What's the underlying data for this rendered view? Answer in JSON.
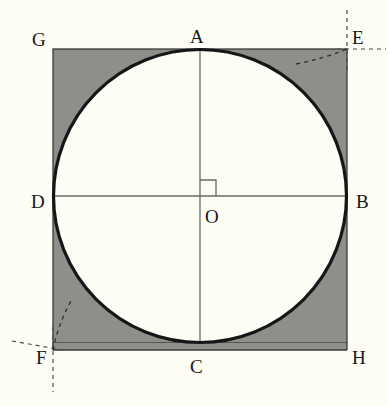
{
  "figure": {
    "background_color": "#fdfdf6",
    "shaded_fill_color": "#8e8e8a",
    "circle_fill_color": "#fdfdf6",
    "outline_color": "#161616",
    "thin_line_color": "#6b6b66",
    "dashed_line_color": "#4a4a46"
  },
  "square": {
    "name": "GEHF",
    "left": 53,
    "top": 49,
    "side": 294,
    "stroke_width": 1.2
  },
  "circle": {
    "center_x": 200,
    "center_y": 196,
    "radius": 147,
    "stroke_width": 3
  },
  "center_point": {
    "label": "O",
    "x": 200,
    "y": 196
  },
  "right_angle_marker": {
    "size": 16,
    "quadrant": "upper-right"
  },
  "diameters": [
    {
      "name": "vertical-diameter",
      "from": "A",
      "to": "C"
    },
    {
      "name": "horizontal-diameter",
      "from": "D",
      "to": "B"
    }
  ],
  "labels": [
    {
      "id": "G",
      "text": "G",
      "x": 32,
      "y": 30,
      "role": "square-corner-top-left"
    },
    {
      "id": "A",
      "text": "A",
      "x": 190,
      "y": 27,
      "role": "circle-tangent-top"
    },
    {
      "id": "E",
      "text": "E",
      "x": 352,
      "y": 28,
      "role": "square-corner-top-right"
    },
    {
      "id": "D",
      "text": "D",
      "x": 31,
      "y": 192,
      "role": "circle-tangent-left"
    },
    {
      "id": "O",
      "text": "O",
      "x": 205,
      "y": 207,
      "role": "circle-center"
    },
    {
      "id": "B",
      "text": "B",
      "x": 356,
      "y": 192,
      "role": "circle-tangent-right"
    },
    {
      "id": "F",
      "text": "F",
      "x": 36,
      "y": 348,
      "role": "square-corner-bottom-left"
    },
    {
      "id": "C",
      "text": "C",
      "x": 190,
      "y": 357,
      "role": "circle-tangent-bottom"
    },
    {
      "id": "H",
      "text": "H",
      "x": 352,
      "y": 348,
      "role": "square-corner-bottom-right"
    }
  ],
  "construction_marks": [
    {
      "id": "E",
      "name": "corner-construction-E",
      "corner_x": 347,
      "corner_y": 49,
      "arc_direction": "left-inward",
      "ray_vertical": "up",
      "ray_horizontal": "right"
    },
    {
      "id": "F",
      "name": "corner-construction-F",
      "corner_x": 53,
      "corner_y": 350,
      "arc_direction": "up-inward",
      "ray_vertical": "down",
      "ray_horizontal": "left"
    }
  ]
}
